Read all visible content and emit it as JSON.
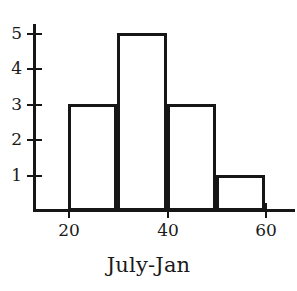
{
  "chart_data": {
    "type": "bar",
    "title": "",
    "subtitle": "",
    "xlabel": "July-Jan",
    "ylabel": "",
    "categories": [
      "20-30",
      "30-40",
      "40-50",
      "50-60"
    ],
    "values": [
      3,
      5,
      3,
      1
    ],
    "bin_edges": [
      20,
      30,
      40,
      50,
      60
    ],
    "bin_width": 10,
    "series": [
      {
        "name": "Frequency",
        "values": [
          3,
          5,
          3,
          1
        ]
      }
    ],
    "x": [
      20,
      30,
      40,
      50
    ],
    "xlim": [
      14,
      67
    ],
    "ylim": [
      0,
      5.35
    ],
    "x_ticks": [
      20,
      40,
      60
    ],
    "x_tick_labels": [
      "20",
      "40",
      "60"
    ],
    "y_ticks": [
      1,
      2,
      3,
      4,
      5
    ],
    "y_tick_labels": [
      "1",
      "2",
      "3",
      "4",
      "5"
    ],
    "grid": false,
    "legend": false,
    "legend_position": "none",
    "bar_fill": "#ffffff",
    "bar_edge_color": "#161616",
    "axis_color": "#161616",
    "background": "#ffffff",
    "annotations": []
  },
  "bars": [
    {
      "name": "bar-20-30",
      "label": "3",
      "value": 3,
      "left": 68,
      "width": 49,
      "top": 104,
      "height": 107
    },
    {
      "name": "bar-30-40",
      "label": "5",
      "value": 5,
      "left": 117,
      "width": 50,
      "top": 33,
      "height": 178
    },
    {
      "name": "bar-40-50",
      "label": "3",
      "value": 3,
      "left": 167,
      "width": 49,
      "top": 104,
      "height": 107
    },
    {
      "name": "bar-50-60",
      "label": "1",
      "value": 1,
      "left": 216,
      "width": 49,
      "top": 175,
      "height": 36
    }
  ],
  "y_axis": {
    "ticks": [
      {
        "label": "5",
        "top": 33
      },
      {
        "label": "4",
        "top": 68
      },
      {
        "label": "3",
        "top": 104
      },
      {
        "label": "2",
        "top": 139
      },
      {
        "label": "1",
        "top": 175
      }
    ]
  },
  "x_axis": {
    "ticks": [
      {
        "label": "20",
        "left": 68
      },
      {
        "label": "40",
        "left": 167
      },
      {
        "label": "60",
        "left": 265
      }
    ]
  },
  "axis_title": {
    "text": "July-Jan"
  }
}
